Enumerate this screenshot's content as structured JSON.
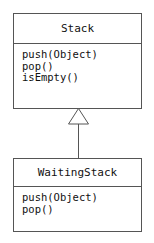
{
  "diagram": {
    "type": "uml-class-diagram",
    "title": "",
    "background_color": "#ffffff",
    "line_color": "#555555",
    "text_color": "#111111",
    "classes": [
      {
        "id": "stack",
        "name": "Stack",
        "attributes": [],
        "methods": [
          "push(Object)",
          "pop()",
          "isEmpty()"
        ]
      },
      {
        "id": "waitingstack",
        "name": "WaitingStack",
        "attributes": [],
        "methods": [
          "push(Object)",
          "pop()"
        ]
      }
    ],
    "relationships": [
      {
        "kind": "generalization",
        "label": "",
        "from": "WaitingStack",
        "to": "Stack",
        "arrowhead": "hollow-triangle"
      }
    ]
  }
}
